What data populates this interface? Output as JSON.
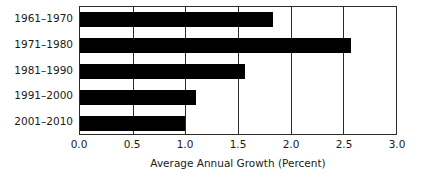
{
  "chart_data": {
    "type": "bar",
    "orientation": "horizontal",
    "title": "",
    "xlabel": "Average Annual Growth (Percent)",
    "ylabel": "",
    "categories": [
      "1961–1970",
      "1971–1980",
      "1981–1990",
      "1991–2000",
      "2001–2010"
    ],
    "values": [
      1.83,
      2.57,
      1.57,
      1.1,
      1.0
    ],
    "xlim": [
      0.0,
      3.0
    ],
    "xticks": [
      0.0,
      0.5,
      1.0,
      1.5,
      2.0,
      2.5,
      3.0
    ],
    "xtick_labels": [
      "0.0",
      "0.5",
      "1.0",
      "1.5",
      "2.0",
      "2.5",
      "3.0"
    ],
    "grid": "vertical",
    "legend": "none",
    "bar_color": "#000000",
    "background_color": "#ffffff",
    "axis_color": "#2b2b2b"
  }
}
